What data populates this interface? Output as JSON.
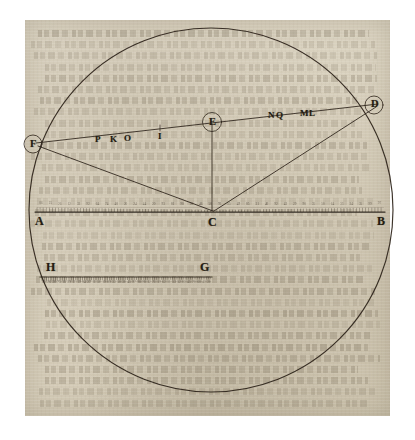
{
  "figure": {
    "type": "geometric-diagram",
    "medium": "engraving on aged paper"
  },
  "points": {
    "A": {
      "label": "A",
      "role": "left-end-of-diameter"
    },
    "B": {
      "label": "B",
      "role": "right-end-of-diameter"
    },
    "C": {
      "label": "C",
      "role": "center-of-circle"
    },
    "D": {
      "label": "D",
      "role": "upper-right-point-on-circumference",
      "circled": true
    },
    "E": {
      "label": "E",
      "role": "point-on-chord-above-center",
      "circled": true
    },
    "F": {
      "label": "F",
      "role": "upper-left-point-on-circumference",
      "circled": true
    },
    "G": {
      "label": "G",
      "role": "right-end-of-lower-scale"
    },
    "H": {
      "label": "H",
      "role": "left-end-of-lower-scale"
    }
  },
  "chord_labels": {
    "left_group": [
      "P",
      "K",
      "O"
    ],
    "mid": "I",
    "right_group_1": [
      "N",
      "Q"
    ],
    "right_group_2": [
      "M",
      "L"
    ]
  },
  "scales": {
    "diameter_scale": {
      "left_label": "A",
      "right_label": "B",
      "center_label": "C",
      "graduated": true
    },
    "lower_scale": {
      "left_label": "H",
      "right_label": "G",
      "graduated": true
    }
  },
  "colors": {
    "ink": "#241c12",
    "line": "#2b2218",
    "paper": "#d8d0bd",
    "paper_shadow": "#bdb39a"
  }
}
